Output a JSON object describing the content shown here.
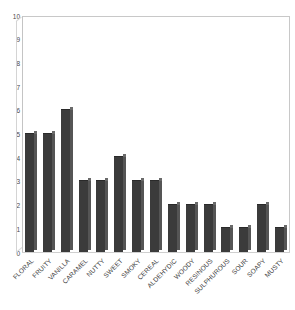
{
  "chart_data": {
    "type": "bar",
    "title": "",
    "subtitle": "",
    "xlabel": "",
    "ylabel": "",
    "ylim": [
      0,
      10
    ],
    "ytick_step": 1,
    "grid": false,
    "legend": false,
    "legend_position": "none",
    "bar_style": "3d-column",
    "bar_color": "#3b3b3b",
    "bar_side_color": "#555555",
    "bar_top_color": "#6a6a6a",
    "frame_color": "#c8c8c8",
    "axis_text_color": "#3d3d3d",
    "background_color": "#ffffff",
    "xtick_rotation": -45,
    "yticks": [
      "0",
      "1",
      "2",
      "3",
      "4",
      "5",
      "6",
      "7",
      "8",
      "9",
      "10"
    ],
    "categories": [
      "FLORAL",
      "FRUITY",
      "VANILLA",
      "CARAMEL",
      "NUTTY",
      "SWEET",
      "SMOKY",
      "CEREAL",
      "ALDEHYDIC",
      "WOODY",
      "RESINOUS",
      "SULPHUROUS",
      "SOUR",
      "SOAPY",
      "MUSTY"
    ],
    "values": [
      5,
      5,
      6,
      3,
      3,
      4,
      3,
      3,
      2,
      2,
      2,
      1,
      1,
      2,
      1
    ]
  }
}
